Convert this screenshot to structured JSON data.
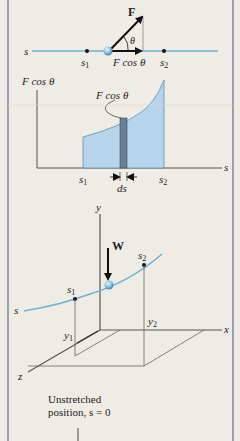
{
  "panel1": {
    "axis_label": "s",
    "point1": "s",
    "point1_sub": "1",
    "point2": "s",
    "point2_sub": "2",
    "force_label": "F",
    "angle_label": "θ",
    "component_label": "F cos θ"
  },
  "panel2": {
    "y_axis_label": "F cos θ",
    "x_axis_label": "s",
    "curve_label": "F cos θ",
    "tick1": "s",
    "tick1_sub": "1",
    "tick2": "s",
    "tick2_sub": "2",
    "ds_label": "ds"
  },
  "panel3": {
    "y_axis": "y",
    "x_axis": "x",
    "z_axis": "z",
    "path_label": "s",
    "weight_label": "W",
    "point1": "s",
    "point1_sub": "1",
    "point2": "s",
    "point2_sub": "2",
    "height1": "y",
    "height1_sub": "1",
    "height2": "y",
    "height2_sub": "2"
  },
  "panel4": {
    "line1": "Unstretched",
    "line2": "position, s = 0"
  },
  "colors": {
    "background": "#efece6",
    "border": "#7c8796",
    "path_blue": "#6fb2d6",
    "area_fill": "#b7d4ea",
    "strip_fill": "#6a7f94",
    "ball": "#8fc3e4"
  }
}
